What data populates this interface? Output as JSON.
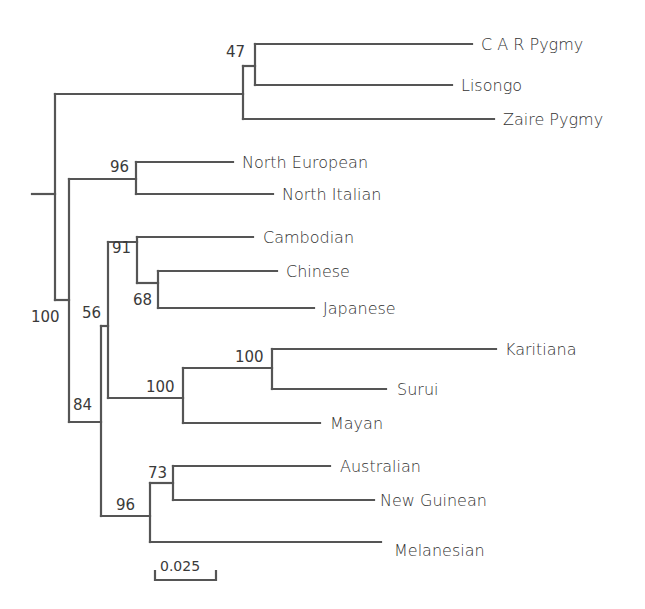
{
  "figure": {
    "type": "phylogenetic-tree",
    "line_color": "#555555",
    "text_color": "#333333",
    "background": "#ffffff"
  },
  "leaves": [
    {
      "name": "C A R Pygmy"
    },
    {
      "name": "Lisongo"
    },
    {
      "name": "Zaire Pygmy"
    },
    {
      "name": "North European"
    },
    {
      "name": "North Italian"
    },
    {
      "name": "Cambodian"
    },
    {
      "name": "Chinese"
    },
    {
      "name": "Japanese"
    },
    {
      "name": "Karitiana"
    },
    {
      "name": "Surui"
    },
    {
      "name": "Mayan"
    },
    {
      "name": "Australian"
    },
    {
      "name": "New Guinean"
    },
    {
      "name": "Melanesian"
    }
  ],
  "support_values": {
    "pygmy_lisongo": "47",
    "european": "96",
    "non_african": "100",
    "east_asian": "91",
    "chinese_japanese": "68",
    "asian_american": "56",
    "amerind": "100",
    "karitiana_surui": "100",
    "asia_oceania": "84",
    "oceania": "96",
    "australia_newguinea": "73"
  },
  "scale_bar": {
    "label": "0.025"
  }
}
